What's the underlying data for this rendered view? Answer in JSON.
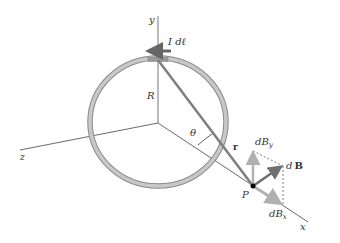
{
  "diagram": {
    "labels": {
      "y_axis": "y",
      "z_axis": "z",
      "x_axis": "x",
      "current_element": "I dℓ",
      "radius": "R",
      "angle": "θ",
      "r_vector": "r",
      "point": "P",
      "dBy": "dB",
      "dBy_sub": "y",
      "dB": "d",
      "dB_bold": "B",
      "dBx": "dB",
      "dBx_sub": "x"
    },
    "colors": {
      "ring": "#b5b5b5",
      "ring_edge": "#7a7a7a",
      "axis": "#444444",
      "r_line": "#7f7f7f",
      "dB_arrow": "#6f6f6f",
      "component_arrow": "#b0b0b0",
      "current_arrow": "#666666"
    }
  }
}
